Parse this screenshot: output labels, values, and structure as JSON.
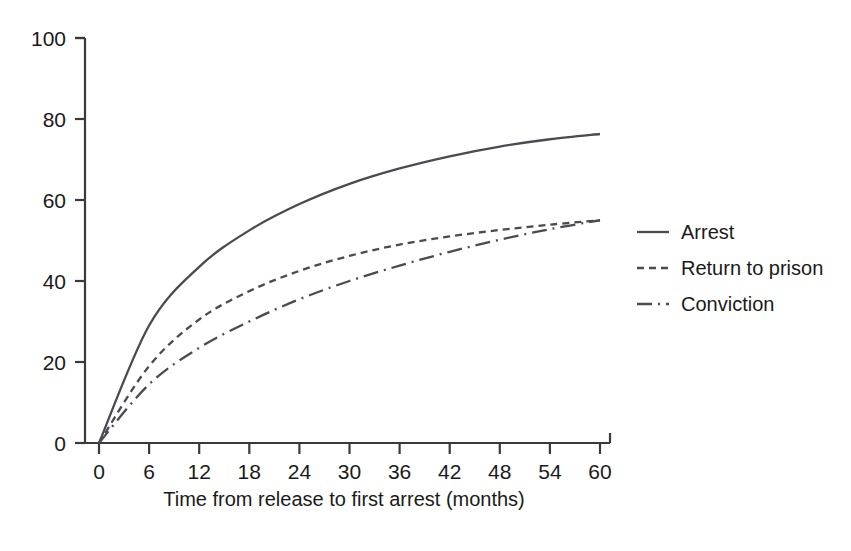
{
  "figure": {
    "background": "#ffffff",
    "line_color": "#4a4a52",
    "axis_color": "#3a3a3a",
    "text_color": "#1a1a1a"
  },
  "chart_data": {
    "type": "line",
    "title": "",
    "subtitle": "",
    "xlabel": "Time from release to first arrest (months)",
    "ylabel": "",
    "xlim": [
      0,
      60
    ],
    "ylim": [
      0,
      100
    ],
    "xticks": [
      0,
      6,
      12,
      18,
      24,
      30,
      36,
      42,
      48,
      54,
      60
    ],
    "yticks": [
      0,
      20,
      40,
      60,
      80,
      100
    ],
    "xtick_labels": [
      "0",
      "6",
      "12",
      "18",
      "24",
      "30",
      "36",
      "42",
      "48",
      "54",
      "60"
    ],
    "ytick_labels": [
      "0",
      "20",
      "40",
      "60",
      "80",
      "100"
    ],
    "grid": false,
    "legend_position": "right",
    "x": [
      0,
      6,
      12,
      18,
      24,
      30,
      36,
      42,
      48,
      54,
      60
    ],
    "series": [
      {
        "name": "Arrest",
        "style": "solid",
        "color": "#4a4a52",
        "values": [
          0,
          29.0,
          43.5,
          52.5,
          59.0,
          64.0,
          67.8,
          70.8,
          73.2,
          75.0,
          76.3
        ]
      },
      {
        "name": "Return to prison",
        "style": "dotted",
        "color": "#4a4a52",
        "values": [
          0,
          19.0,
          30.5,
          37.5,
          42.5,
          46.2,
          49.0,
          51.0,
          52.6,
          53.9,
          55.0
        ]
      },
      {
        "name": "Conviction",
        "style": "dashdot",
        "color": "#4a4a52",
        "values": [
          0,
          14.5,
          23.5,
          30.0,
          35.5,
          40.0,
          43.8,
          47.2,
          50.2,
          52.8,
          55.0
        ]
      }
    ]
  },
  "legend": {
    "items": [
      {
        "label": "Arrest",
        "style": "solid"
      },
      {
        "label": "Return to prison",
        "style": "dotted"
      },
      {
        "label": "Conviction",
        "style": "dashdot"
      }
    ]
  }
}
